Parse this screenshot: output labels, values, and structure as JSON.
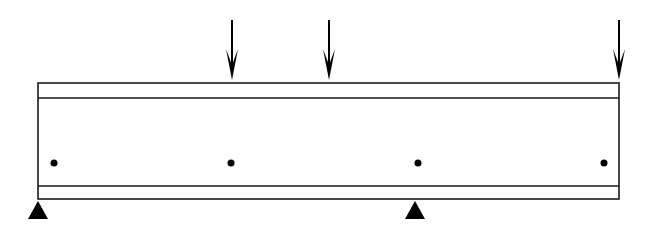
{
  "diagram": {
    "type": "beam-loading",
    "colors": {
      "stroke": "#1a1a1a",
      "fill": "#000000",
      "background": "#ffffff"
    },
    "beam": {
      "x1": 38,
      "x2": 619,
      "top": 83,
      "inner_top": 98,
      "inner_bottom": 186,
      "bottom": 199
    },
    "loads": [
      {
        "id": "load-1",
        "x": 232,
        "y_start": 20,
        "y_tip": 80
      },
      {
        "id": "load-2",
        "x": 329,
        "y_start": 20,
        "y_tip": 80
      },
      {
        "id": "load-3",
        "x": 619,
        "y_start": 20,
        "y_tip": 80
      }
    ],
    "supports": [
      {
        "id": "support-left",
        "x": 38,
        "y_apex": 201,
        "y_base": 219
      },
      {
        "id": "support-middle",
        "x": 415,
        "y_apex": 201,
        "y_base": 219
      }
    ],
    "points": [
      {
        "id": "dot-1",
        "x": 54,
        "y": 163
      },
      {
        "id": "dot-2",
        "x": 231,
        "y": 163
      },
      {
        "id": "dot-3",
        "x": 418,
        "y": 163
      },
      {
        "id": "dot-4",
        "x": 604,
        "y": 163
      }
    ]
  }
}
